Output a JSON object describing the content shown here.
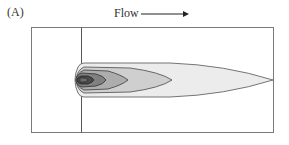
{
  "figure": {
    "panel_label": "(A)",
    "flow_label": "Flow",
    "flow_direction": "right",
    "colors": {
      "frame": "#7a7a7a",
      "contour_outer": "#ececec",
      "contour_2": "#c8c8c8",
      "contour_3": "#a8a8a8",
      "contour_4": "#7e7e7e",
      "contour_core": "#4a4a4a",
      "outline": "#555555"
    }
  }
}
